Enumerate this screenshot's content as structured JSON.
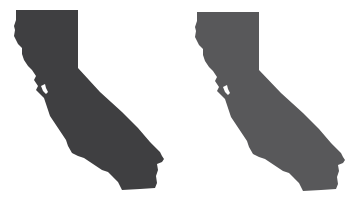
{
  "maps": [
    {
      "name": "california-dark",
      "fill": "#3f3f41"
    },
    {
      "name": "california-gray",
      "fill": "#58585a"
    }
  ]
}
